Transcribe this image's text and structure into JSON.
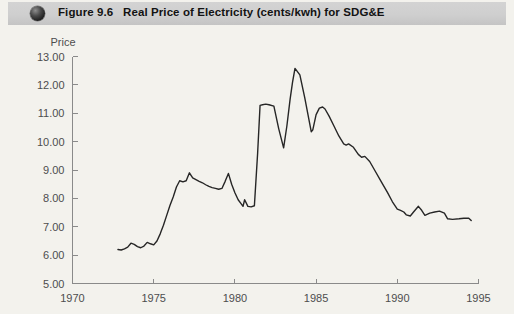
{
  "figure": {
    "number_label": "Figure 9.6",
    "title": "Real Price of Electricity (cents/kwh) for SDG&E",
    "bullet_icon": "filled-circle-icon",
    "header_bg": "#cfcfcf",
    "page_bg": "#f3f2ed",
    "line_color": "#262626",
    "axis_color": "#8a8a8a"
  },
  "chart_data": {
    "type": "line",
    "title": "Real Price of Electricity (cents/kwh) for SDG&E",
    "xlabel": "",
    "ylabel": "Price",
    "xlim": [
      1970,
      1995
    ],
    "ylim": [
      5.0,
      13.0
    ],
    "xticks": [
      1970,
      1975,
      1980,
      1985,
      1990,
      1995
    ],
    "xtick_labels": [
      "1970",
      "1975",
      "1980",
      "1985",
      "1990",
      "1995"
    ],
    "yticks": [
      5.0,
      6.0,
      7.0,
      8.0,
      9.0,
      10.0,
      11.0,
      12.0,
      13.0
    ],
    "ytick_labels": [
      "5.00",
      "6.00",
      "7.00",
      "8.00",
      "9.00",
      "10.00",
      "11.00",
      "12.00",
      "13.00"
    ],
    "grid": false,
    "legend": null,
    "series": [
      {
        "name": "Real price of electricity (cents/kwh)",
        "x": [
          1972.8,
          1973.0,
          1973.2,
          1973.4,
          1973.6,
          1973.8,
          1974.0,
          1974.2,
          1974.4,
          1974.6,
          1974.8,
          1975.0,
          1975.2,
          1975.4,
          1975.6,
          1975.8,
          1976.0,
          1976.2,
          1976.4,
          1976.6,
          1976.8,
          1977.0,
          1977.2,
          1977.4,
          1977.6,
          1977.8,
          1978.0,
          1978.2,
          1978.4,
          1978.6,
          1978.8,
          1979.0,
          1979.2,
          1979.4,
          1979.6,
          1979.8,
          1980.0,
          1980.2,
          1980.4,
          1980.5,
          1980.6,
          1980.8,
          1981.0,
          1981.2,
          1981.4,
          1981.55,
          1981.7,
          1981.9,
          1982.1,
          1982.4,
          1982.7,
          1983.0,
          1983.2,
          1983.4,
          1983.55,
          1983.7,
          1984.0,
          1984.3,
          1984.55,
          1984.7,
          1984.8,
          1985.0,
          1985.2,
          1985.4,
          1985.55,
          1985.8,
          1986.1,
          1986.4,
          1986.7,
          1986.85,
          1987.0,
          1987.3,
          1987.6,
          1987.8,
          1988.0,
          1988.3,
          1988.6,
          1989.0,
          1989.4,
          1989.7,
          1990.0,
          1990.2,
          1990.4,
          1990.55,
          1990.8,
          1991.0,
          1991.3,
          1991.5,
          1991.7,
          1992.0,
          1992.3,
          1992.6,
          1992.9,
          1993.1,
          1993.4,
          1993.8,
          1994.1,
          1994.4,
          1994.55
        ],
        "y": [
          6.2,
          6.18,
          6.22,
          6.28,
          6.42,
          6.38,
          6.3,
          6.26,
          6.32,
          6.45,
          6.4,
          6.36,
          6.5,
          6.75,
          7.05,
          7.4,
          7.75,
          8.05,
          8.4,
          8.62,
          8.58,
          8.62,
          8.9,
          8.72,
          8.66,
          8.6,
          8.55,
          8.48,
          8.42,
          8.38,
          8.35,
          8.32,
          8.35,
          8.6,
          8.88,
          8.5,
          8.2,
          7.95,
          7.8,
          7.72,
          7.95,
          7.72,
          7.7,
          7.74,
          9.6,
          11.28,
          11.3,
          11.32,
          11.3,
          11.25,
          10.45,
          9.78,
          10.55,
          11.5,
          12.1,
          12.58,
          12.35,
          11.55,
          10.8,
          10.35,
          10.42,
          10.95,
          11.18,
          11.22,
          11.15,
          10.9,
          10.55,
          10.2,
          9.92,
          9.88,
          9.92,
          9.8,
          9.55,
          9.45,
          9.48,
          9.3,
          9.0,
          8.6,
          8.2,
          7.88,
          7.62,
          7.58,
          7.52,
          7.42,
          7.38,
          7.52,
          7.72,
          7.58,
          7.4,
          7.48,
          7.52,
          7.55,
          7.48,
          7.28,
          7.26,
          7.28,
          7.3,
          7.3,
          7.22
        ]
      }
    ]
  }
}
